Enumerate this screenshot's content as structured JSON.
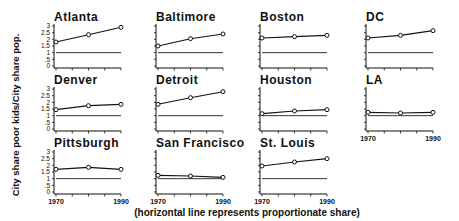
{
  "chart_data": {
    "type": "line",
    "layout": "small-multiples",
    "ylabel": "City share poor kids/City share pop.",
    "note": "(horizontal line represents proportionate share)",
    "x": [
      1970,
      1980,
      1990
    ],
    "xlim": [
      1970,
      1990
    ],
    "x_tick_labels": [
      "1970",
      "1990"
    ],
    "ylim": [
      0,
      3
    ],
    "y_ticks": [
      0,
      0.5,
      1,
      1.5,
      2,
      2.5,
      3
    ],
    "y_tick_labels": [
      "0",
      ".5",
      "1",
      "1.5",
      "2",
      "2.5",
      "3"
    ],
    "reference_line": 1,
    "grid": false,
    "panels": [
      {
        "name": "Atlanta",
        "values": [
          1.8,
          2.35,
          2.9
        ]
      },
      {
        "name": "Baltimore",
        "values": [
          1.5,
          2.05,
          2.4
        ]
      },
      {
        "name": "Boston",
        "values": [
          2.1,
          2.2,
          2.3
        ]
      },
      {
        "name": "DC",
        "values": [
          2.1,
          2.3,
          2.65
        ]
      },
      {
        "name": "Denver",
        "values": [
          1.45,
          1.75,
          1.85
        ]
      },
      {
        "name": "Detroit",
        "values": [
          1.85,
          2.35,
          2.8
        ]
      },
      {
        "name": "Houston",
        "values": [
          1.15,
          1.35,
          1.45
        ]
      },
      {
        "name": "LA",
        "values": [
          1.25,
          1.2,
          1.25
        ]
      },
      {
        "name": "Pittsburgh",
        "values": [
          1.7,
          1.85,
          1.7
        ]
      },
      {
        "name": "San Francisco",
        "values": [
          1.25,
          1.2,
          1.1
        ]
      },
      {
        "name": "St. Louis",
        "values": [
          1.95,
          2.25,
          2.5
        ]
      }
    ]
  }
}
